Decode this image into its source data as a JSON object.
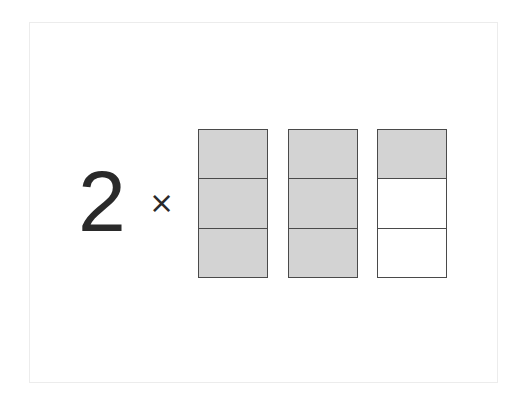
{
  "expression": {
    "multiplier": "2",
    "operator_symbol": "×",
    "operator_icon": "times-icon"
  },
  "fraction_model": {
    "parts_per_whole": 3,
    "total_shaded_parts": 7,
    "represents": "7/3",
    "shaded_color": "#d3d3d3",
    "empty_color": "#ffffff",
    "border_color": "#4a4a4a",
    "bars": [
      {
        "shaded": 3,
        "total": 3
      },
      {
        "shaded": 3,
        "total": 3
      },
      {
        "shaded": 1,
        "total": 3
      }
    ]
  }
}
